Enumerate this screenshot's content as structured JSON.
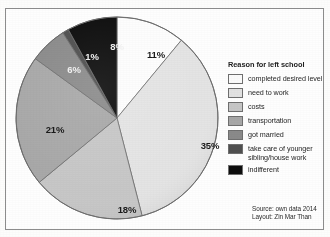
{
  "figure": {
    "background_color": "#fdfdfc",
    "frame_color": "#8d8d8d"
  },
  "legend": {
    "title": "Reason for left school",
    "items": [
      {
        "label": "completed desired level",
        "color": "#fbfbfb"
      },
      {
        "label": "need to work",
        "color": "#e2e2e2"
      },
      {
        "label": "costs",
        "color": "#c6c6c6"
      },
      {
        "label": "transportation",
        "color": "#a7a7a7"
      },
      {
        "label": "got married",
        "color": "#8a8a8a"
      },
      {
        "label": "take care of younger sibling/house work",
        "color": "#4f4f4f"
      },
      {
        "label": "indifferent",
        "color": "#0d0d0d"
      }
    ]
  },
  "credits": {
    "source": "Source: own data 2014",
    "layout": "Layout: Zin Mar Than"
  },
  "chart_data": {
    "type": "pie",
    "title": "",
    "legend_title": "Reason for left school",
    "legend_position": "right",
    "grid": false,
    "start_angle_deg": 0,
    "direction": "clockwise",
    "categories": [
      "completed desired level",
      "need to work",
      "costs",
      "transportation",
      "got married",
      "take care of younger sibling/house work",
      "indifferent"
    ],
    "values": [
      11,
      35,
      18,
      21,
      6,
      1,
      8
    ],
    "value_unit": "%",
    "data_labels": [
      "11%",
      "35%",
      "18%",
      "21%",
      "6%",
      "1%",
      "8%"
    ],
    "colors": [
      "#fbfbfb",
      "#e2e2e2",
      "#c6c6c6",
      "#a7a7a7",
      "#8a8a8a",
      "#4f4f4f",
      "#0d0d0d"
    ],
    "slice_label_positions": [
      {
        "label": "11%",
        "x": 143,
        "y": 40,
        "tone": "dark"
      },
      {
        "label": "35%",
        "x": 197,
        "y": 131,
        "tone": "dark"
      },
      {
        "label": "18%",
        "x": 114,
        "y": 195,
        "tone": "dark"
      },
      {
        "label": "21%",
        "x": 42,
        "y": 115,
        "tone": "dark"
      },
      {
        "label": "6%",
        "x": 61,
        "y": 55,
        "tone": "light"
      },
      {
        "label": "1%",
        "x": 79,
        "y": 42,
        "tone": "light"
      },
      {
        "label": "8%",
        "x": 104,
        "y": 32,
        "tone": "light"
      }
    ]
  }
}
